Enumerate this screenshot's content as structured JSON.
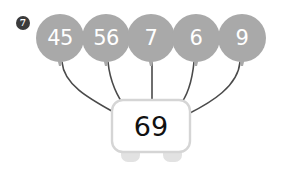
{
  "worksheet": {
    "question_number": "7",
    "background_color": "#ffffff"
  },
  "colors": {
    "balloon_fill": "#a9a9a9",
    "balloon_text": "#ffffff",
    "string_stroke": "#4a4a4a",
    "box_fill": "#ffffff",
    "box_border": "#d5d5d5",
    "box_text": "#111111",
    "badge_fill": "#3b3b3b",
    "badge_text": "#ffffff",
    "foot_fill": "#e2e2e2"
  },
  "balloons": [
    {
      "label": "45",
      "cx": 60,
      "cy": 38
    },
    {
      "label": "56",
      "cx": 106,
      "cy": 38
    },
    {
      "label": "7",
      "cx": 151,
      "cy": 38
    },
    {
      "label": "6",
      "cx": 196,
      "cy": 38
    },
    {
      "label": "9",
      "cx": 242,
      "cy": 38
    }
  ],
  "box": {
    "label": "69",
    "x": 112,
    "y": 100,
    "width": 78,
    "height": 52
  },
  "feet": [
    {
      "cx": 130,
      "cy": 152
    },
    {
      "cx": 172,
      "cy": 152
    }
  ],
  "strings": [
    {
      "from_balloon": "45",
      "path": "M 62 62 C 64 86, 92 100, 117 114"
    },
    {
      "from_balloon": "56",
      "path": "M 108 62 C 110 82, 118 98, 125 106"
    },
    {
      "from_balloon": "7",
      "path": "M 152 62 C 152 80, 152 92, 152 100"
    },
    {
      "from_balloon": "6",
      "path": "M 194 62 C 192 82, 186 98, 179 106"
    },
    {
      "from_balloon": "9",
      "path": "M 240 62 C 238 86, 212 102, 188 114"
    }
  ]
}
